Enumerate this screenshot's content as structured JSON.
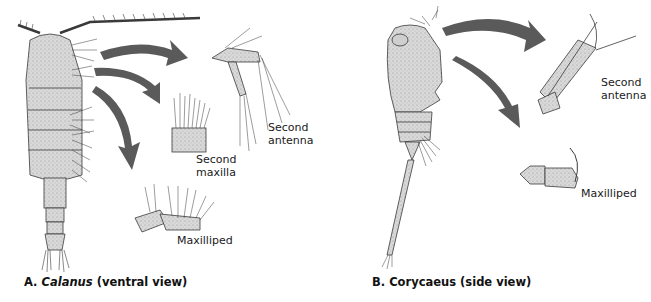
{
  "figure": {
    "panel_a": {
      "caption_prefix": "A.",
      "caption_genus": "Calanus",
      "caption_suffix": "(ventral view)",
      "labels": {
        "second_antenna_1": "Second",
        "second_antenna_2": "antenna",
        "second_maxilla_1": "Second",
        "second_maxilla_2": "maxilla",
        "maxilliped": "Maxilliped"
      }
    },
    "panel_b": {
      "caption_prefix": "B.",
      "caption_genus": "Corycaeus",
      "caption_suffix": "(side view)",
      "labels": {
        "second_antenna_1": "Second",
        "second_antenna_2": "antenna",
        "maxilliped": "Maxilliped"
      }
    },
    "colors": {
      "arrow": "#5a5a5a",
      "body_fill": "#d6d6d6",
      "outline": "#3a3a3a",
      "background": "#ffffff"
    }
  }
}
